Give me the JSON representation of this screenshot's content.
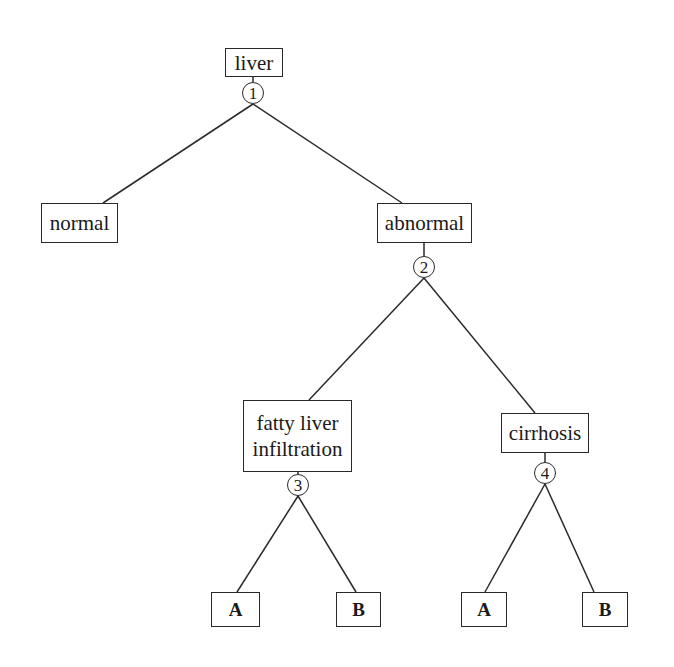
{
  "diagram": {
    "type": "decision-tree",
    "root": {
      "label": "liver",
      "decision_node": "1",
      "children": [
        {
          "label": "normal"
        },
        {
          "label": "abnormal",
          "decision_node": "2",
          "children": [
            {
              "label": "fatty liver infiltration",
              "decision_node": "3",
              "children": [
                {
                  "label": "A"
                },
                {
                  "label": "B"
                }
              ]
            },
            {
              "label": "cirrhosis",
              "decision_node": "4",
              "children": [
                {
                  "label": "A"
                },
                {
                  "label": "B"
                }
              ]
            }
          ]
        }
      ]
    }
  },
  "nodes": {
    "liver": "liver",
    "normal": "normal",
    "abnormal": "abnormal",
    "fatty_line1": "fatty liver",
    "fatty_line2": "infiltration",
    "cirrhosis": "cirrhosis",
    "fatty_a": "A",
    "fatty_b": "B",
    "cirrhosis_a": "A",
    "cirrhosis_b": "B"
  },
  "decision_points": {
    "d1": "1",
    "d2": "2",
    "d3": "3",
    "d4": "4"
  },
  "colors": {
    "ink": "#2a2a2a",
    "background": "#ffffff",
    "show_through_text": "#ececec"
  }
}
